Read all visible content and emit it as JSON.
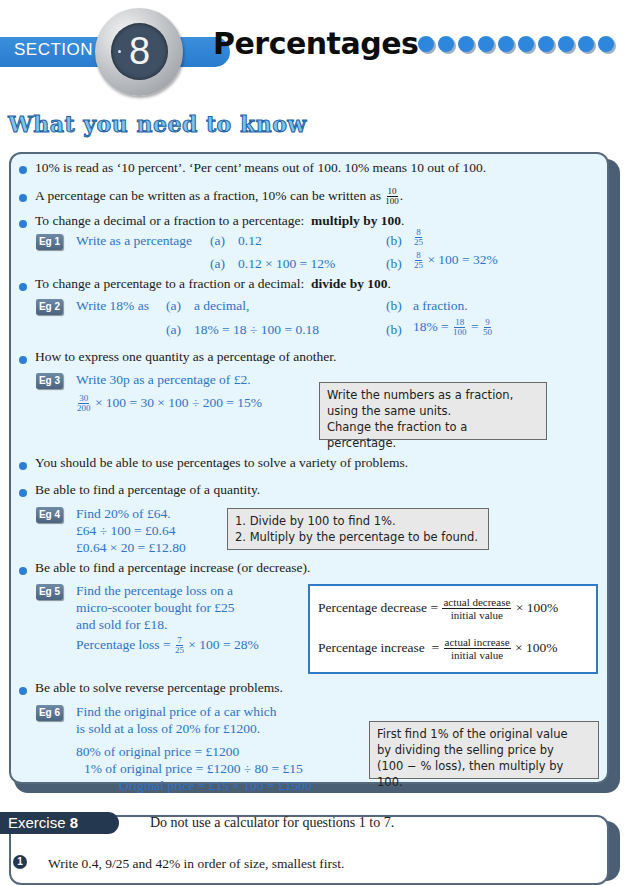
{
  "header": {
    "section_label": "SECTION",
    "section_number": "8",
    "title": "Percentages",
    "decorative_dot_count": 12,
    "accent_color": "#2f86dd"
  },
  "heading": "What you need to know",
  "points": [
    {
      "text": "10% is read as ‘10 percent’.   ‘Per cent’ means out of 100.   10% means 10 out of 100."
    },
    {
      "text": "A percentage can be written as a fraction, 10% can be written as",
      "fraction": {
        "num": "10",
        "den": "100"
      },
      "suffix": "."
    },
    {
      "text": "To change a decimal or a fraction to a percentage:",
      "bold": "multiply by 100",
      "suffix": "."
    },
    {
      "text": "To change a percentage to a fraction or a decimal:",
      "bold": "divide by 100",
      "suffix": "."
    },
    {
      "text": "How to express one quantity as a percentage of another."
    },
    {
      "text": "You should be able to use percentages to solve a variety of problems."
    },
    {
      "text": "Be able to find a percentage of a quantity."
    },
    {
      "text": "Be able to find a percentage increase (or decrease)."
    },
    {
      "text": "Be able to solve reverse percentage problems."
    }
  ],
  "examples": {
    "eg1": {
      "badge": "Eg 1",
      "question": "Write as a percentage",
      "a_label": "(a)",
      "a_value": "0.12",
      "b_label": "(b)",
      "b_frac": {
        "num": "8",
        "den": "25"
      },
      "ans_a": "0.12 × 100 = 12%",
      "ans_b_tail": "× 100 = 32%"
    },
    "eg2": {
      "badge": "Eg 2",
      "question": "Write 18% as",
      "a_label": "(a)",
      "a_value": "a decimal,",
      "b_label": "(b)",
      "b_value": "a fraction.",
      "ans_a": "18% = 18 ÷ 100 = 0.18",
      "ans_b_head": "18% =",
      "ans_b_frac1": {
        "num": "18",
        "den": "100"
      },
      "ans_b_eq": "=",
      "ans_b_frac2": {
        "num": "9",
        "den": "50"
      }
    },
    "eg3": {
      "badge": "Eg 3",
      "question": "Write 30p as a percentage of £2.",
      "frac": {
        "num": "30",
        "den": "200"
      },
      "working": "× 100 = 30 × 100 ÷ 200 = 15%",
      "note": [
        "Write the numbers as a fraction,",
        "using the same units.",
        "Change the fraction to a percentage."
      ]
    },
    "eg4": {
      "badge": "Eg 4",
      "lines": [
        "Find 20% of £64.",
        "£64 ÷ 100  = £0.64",
        "£0.64 × 20 = £12.80"
      ],
      "note": [
        "1.  Divide by 100 to find 1%.",
        "2.  Multiply by the percentage to be found."
      ]
    },
    "eg5": {
      "badge": "Eg 5",
      "lines": [
        "Find the percentage loss on a",
        "micro-scooter bought for £25",
        "and sold for £18."
      ],
      "working_head": "Percentage loss =",
      "working_frac": {
        "num": "7",
        "den": "25"
      },
      "working_tail": "× 100 = 28%",
      "formulas": [
        {
          "label": "Percentage decrease",
          "num": "actual decrease",
          "den": "initial value",
          "tail": "× 100%"
        },
        {
          "label": "Percentage increase",
          "num": "actual increase",
          "den": "initial value",
          "tail": "× 100%"
        }
      ]
    },
    "eg6": {
      "badge": "Eg 6",
      "lines": [
        "Find the original price of a car which",
        "is sold at a loss of 20% for £1200."
      ],
      "working": [
        "80% of original price = £1200",
        "1% of original price = £1200 ÷ 80 = £15",
        "Original price = £15 × 100 = £1500"
      ],
      "note": [
        "First find 1% of the original value",
        "by dividing the selling price by",
        "(100 − % loss), then multiply by 100."
      ]
    }
  },
  "exercise": {
    "label": "Exercise",
    "number": "8",
    "instruction": "Do not use a calculator for questions 1 to 7.",
    "q1_number": "1",
    "q1_text_partial": "Write  0.4,   9/25   and  42%  in order of size, smallest first."
  }
}
